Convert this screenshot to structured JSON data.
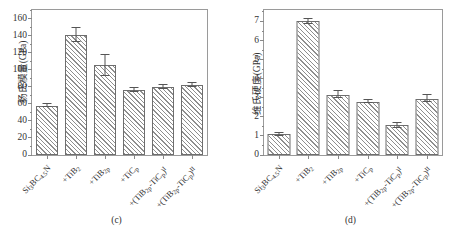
{
  "figure": {
    "width": 467,
    "height": 231,
    "background": "#ffffff",
    "bar_edge_color": "#6e6e6e",
    "hatch_color": "#8e8e8e",
    "axis_color": "#9a9a9a"
  },
  "panels": [
    {
      "id": "c",
      "caption": "(c)",
      "chart_data": {
        "type": "bar",
        "title": "",
        "xlabel": "",
        "ylabel": "杨氏模量(GPa)",
        "ylim": [
          0,
          170
        ],
        "ytick_labels": [
          "0",
          "20",
          "40",
          "60",
          "80",
          "100",
          "120",
          "140",
          "160"
        ],
        "ytick_values": [
          0,
          20,
          40,
          60,
          80,
          100,
          120,
          140,
          160
        ],
        "minor_ytick_values": [
          10,
          30,
          50,
          70,
          90,
          110,
          130,
          150,
          170
        ],
        "grid": false,
        "legend": "none",
        "categories": [
          "Si₃BC₄.₅N",
          "+TiB₂",
          "+TiB₂p",
          "+TiC p",
          "+(TiB₂-TiC p)ⁱ",
          "+(TiB₂-TiC p)ⁱⁱ"
        ],
        "category_html": [
          "Si<sub>3</sub>BC<sub>4.5</sub>N",
          "+TiB<sub>2</sub>",
          "+TiB<sub>2p</sub>",
          "+TiC<sub>p</sub>",
          "+(TiB<sub>2p</sub>-TiC<sub>p</sub>)<sup>I</sup>",
          "+(TiB<sub>2p</sub>-TiC<sub>p</sub>)<sup>II</sup>"
        ],
        "values": [
          58,
          141,
          105,
          76,
          79.5,
          82
        ],
        "errors": [
          2,
          8,
          12,
          2,
          2.5,
          2
        ]
      }
    },
    {
      "id": "d",
      "caption": "(d)",
      "chart_data": {
        "type": "bar",
        "title": "",
        "xlabel": "",
        "ylabel": "维氏硬度(GPa)",
        "ylim": [
          0,
          7.6
        ],
        "ytick_labels": [
          "0",
          "1",
          "2",
          "3",
          "4",
          "5",
          "6",
          "7"
        ],
        "ytick_values": [
          0,
          1,
          2,
          3,
          4,
          5,
          6,
          7
        ],
        "minor_ytick_values": [
          0.5,
          1.5,
          2.5,
          3.5,
          4.5,
          5.5,
          6.5,
          7.5
        ],
        "grid": false,
        "legend": "none",
        "categories": [
          "Si₃BC₄.₅N",
          "+TiB₂",
          "+TiB₂p",
          "+TiC p",
          "+(TiB₂-TiC p)ⁱ",
          "+(TiB₂-TiC p)ⁱⁱ"
        ],
        "category_html": [
          "Si<sub>3</sub>BC<sub>4.5</sub>N",
          "+TiB<sub>2</sub>",
          "+TiB<sub>2p</sub>",
          "+TiC<sub>p</sub>",
          "+(TiB<sub>2p</sub>-TiC<sub>p</sub>)<sup>I</sup>",
          "+(TiB<sub>2p</sub>-TiC<sub>p</sub>)<sup>II</sup>"
        ],
        "values": [
          1.1,
          7.0,
          3.15,
          2.8,
          1.55,
          2.95
        ],
        "errors": [
          0.08,
          0.12,
          0.18,
          0.07,
          0.13,
          0.17
        ]
      }
    }
  ]
}
